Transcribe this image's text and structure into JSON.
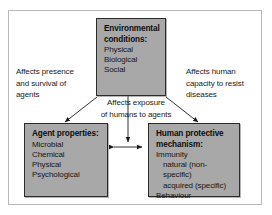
{
  "diagram": {
    "colors": {
      "box_fill": "#a8a8a8",
      "box_border": "#2b2b2b",
      "frame_border": "#b9b9b9",
      "text": "#111111",
      "arrow": "#1a1a1a",
      "background": "#ffffff"
    },
    "nodes": [
      {
        "id": "environmental-conditions",
        "title": "Environmental",
        "title2": "conditions:",
        "items": [
          "Physical",
          "Biological",
          "Social"
        ]
      },
      {
        "id": "agent-properties",
        "title": "Agent properties:",
        "items": [
          "Microbial",
          "Chemical",
          "Physical",
          "Psychological"
        ]
      },
      {
        "id": "human-protective-mechanism",
        "title": "Human protective",
        "title2": "mechanism:",
        "items": [
          "Immunity",
          "natural (non-specific)",
          "acquired (specific)",
          "Behaviour"
        ],
        "indented": [
          "natural (non-specific)",
          "acquired (specific)"
        ]
      }
    ],
    "edges": [
      {
        "id": "env-to-agent",
        "label": "Affects presence and survival of agents",
        "label_lines": [
          "Affects presence",
          "and survival of",
          "agents"
        ],
        "from": "environmental-conditions",
        "to": "agent-properties",
        "arrowheads": "single"
      },
      {
        "id": "env-to-exposure",
        "label": "Affects exposure of humans to agents",
        "label_lines": [
          "Affects exposure",
          "of humans to agents"
        ],
        "from": "environmental-conditions",
        "to": "agent-human-interaction",
        "arrowheads": "single"
      },
      {
        "id": "env-to-human",
        "label": "Affects human capacity to resist diseases",
        "label_lines": [
          "Affects human",
          "capacity to resist",
          "diseases"
        ],
        "from": "environmental-conditions",
        "to": "human-protective-mechanism",
        "arrowheads": "single"
      },
      {
        "id": "agent-human-interaction",
        "label": "",
        "from": "agent-properties",
        "to": "human-protective-mechanism",
        "arrowheads": "double"
      }
    ]
  }
}
